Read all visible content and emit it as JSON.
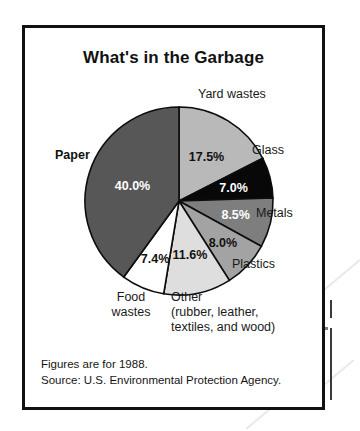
{
  "figure": {
    "title": "What's in the Garbage",
    "footnotes": [
      "Figures are for 1988.",
      "Source:  U.S. Environmental Protection Agency."
    ]
  },
  "labels": {
    "yard_wastes": "Yard wastes",
    "glass": "Glass",
    "metals": "Metals",
    "plastics": "Plastics",
    "food_wastes_line1": "Food",
    "food_wastes_line2": "wastes",
    "paper": "Paper",
    "other_line1": "Other",
    "other_line2": "(rubber, leather,",
    "other_line3": "textiles, and wood)"
  },
  "chart_data": {
    "type": "pie",
    "title": "What's in the Garbage",
    "subtitle": "",
    "xlabel": "",
    "ylabel": "",
    "units": "percent",
    "start_angle_deg": 0,
    "direction": "clockwise",
    "legend": "none (labels placed around pie)",
    "grid": false,
    "categories": [
      "Yard wastes",
      "Glass",
      "Metals",
      "Plastics",
      "Other (rubber, leather, textiles, and wood)",
      "Food wastes",
      "Paper"
    ],
    "values": [
      17.5,
      7.0,
      8.5,
      8.0,
      11.6,
      7.4,
      40.0
    ],
    "data_labels": [
      "17.5%",
      "7.0%",
      "8.5%",
      "8.0%",
      "11.6%",
      "7.4%",
      "40.0%"
    ],
    "slice_fills": [
      "#b9b9b9",
      "#080808",
      "#7e7e7e",
      "#a3a3a3",
      "#dedede",
      "#ffffff",
      "#575757"
    ],
    "slice_label_colors": [
      "#111111",
      "#ffffff",
      "#ffffff",
      "#111111",
      "#111111",
      "#111111",
      "#ffffff"
    ],
    "total": 100.0,
    "annotations": [
      "Figures are for 1988.",
      "Source:  U.S. Environmental Protection Agency."
    ]
  }
}
